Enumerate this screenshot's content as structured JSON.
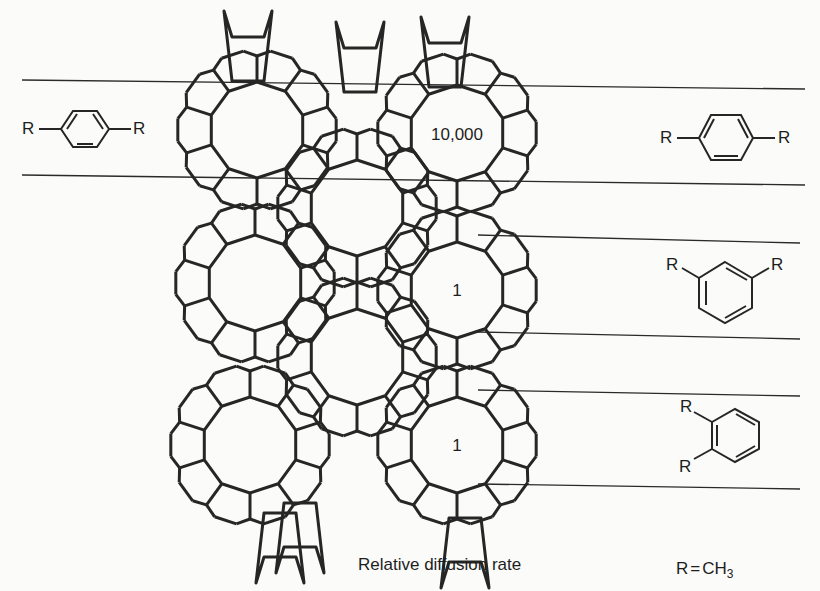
{
  "figure": {
    "caption": "Relative diffusion rate",
    "substituent_definition": {
      "left": "R",
      "equals": "=",
      "right_main": "CH",
      "right_sub": "3"
    }
  },
  "framework": {
    "description": "Zeolite channel framework (10-membered rings with pentasil units)",
    "ring_labels": [
      {
        "id": "top-right-channel",
        "text": "10,000",
        "cx": 457,
        "cy": 133
      },
      {
        "id": "middle-right-channel",
        "text": "1",
        "cx": 457,
        "cy": 290
      },
      {
        "id": "bottom-right-channel",
        "text": "1",
        "cx": 457,
        "cy": 445
      }
    ]
  },
  "molecules": [
    {
      "id": "para-xylene-left",
      "name": "para-xylene",
      "substituent": "R",
      "position": "left"
    },
    {
      "id": "para-xylene-right",
      "name": "para-xylene",
      "substituent": "R",
      "rate": "10,000"
    },
    {
      "id": "meta-xylene",
      "name": "meta-xylene",
      "substituent": "R",
      "rate": "1"
    },
    {
      "id": "ortho-xylene",
      "name": "ortho-xylene",
      "substituent": "R",
      "rate": "1"
    }
  ],
  "r_label": "R",
  "colors": {
    "line": "#262626",
    "background": "#fbfbf9"
  }
}
